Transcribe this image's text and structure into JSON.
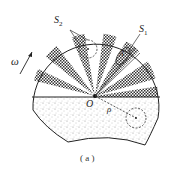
{
  "diagram": {
    "labels": {
      "s2": "S",
      "s2_sub": "2",
      "s1": "S",
      "s1_sub": "1",
      "omega": "ω",
      "origin": "O",
      "rho": "ρ",
      "a": "A"
    },
    "caption": "( a )",
    "colors": {
      "ink": "#222222",
      "fill_background": "#ffffff",
      "stipple": "#999999"
    },
    "upper_half": {
      "description": "fan of alternating cross-hatched and white sectors radiating from O",
      "sector_count": 12
    },
    "lower_half": {
      "description": "stippled (dotted) region with dashed circle at distance rho from O"
    }
  }
}
